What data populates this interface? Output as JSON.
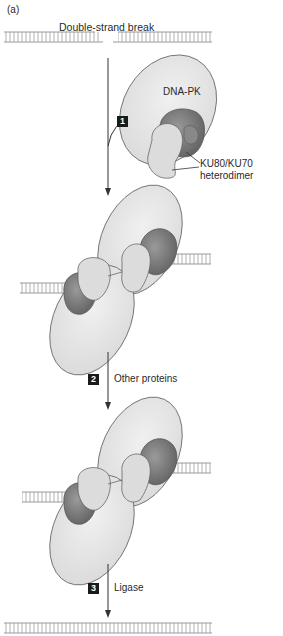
{
  "figure": {
    "panel_label": "(a)",
    "title": "Double-strand break",
    "labels": {
      "dna_pk": "DNA-PK",
      "ku_line1": "KU80/KU70",
      "ku_line2": "heterodimer"
    },
    "steps": [
      {
        "number": "1",
        "label": ""
      },
      {
        "number": "2",
        "label": "Other proteins"
      },
      {
        "number": "3",
        "label": "Ligase"
      }
    ],
    "colors": {
      "dna_pk_fill": "#e6e6e6",
      "ku_light": "#dcdcdc",
      "ku_dark": "#7a7a7a",
      "dna_strand": "#9a9a9a",
      "outline": "#555555",
      "step_box": "#1a1a1a"
    }
  }
}
